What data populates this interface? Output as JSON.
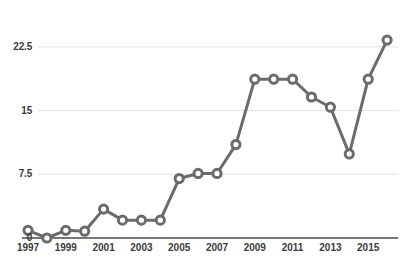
{
  "chart_data": {
    "type": "line",
    "title": "",
    "subtitle": "",
    "xlabel": "",
    "ylabel": "",
    "grid": true,
    "legend": null,
    "legend_position": "none",
    "line_color": "#6b6b6b",
    "marker_face_color": "#ffffff",
    "marker_edge_color": "#6b6b6b",
    "gridline_color": "#e2e2e2",
    "axis_color": "#4a4a4a",
    "ylim": [
      0,
      24.5
    ],
    "yticks": [
      0,
      7.5,
      15,
      22.5
    ],
    "ytick_labels": [
      "0",
      "7.5",
      "15",
      "22.5"
    ],
    "xlim": [
      1997,
      2016
    ],
    "xticks": [
      1997,
      1999,
      2001,
      2003,
      2005,
      2007,
      2009,
      2011,
      2013,
      2015
    ],
    "xtick_labels": [
      "1997",
      "1999",
      "2001",
      "2003",
      "2005",
      "2007",
      "2009",
      "2011",
      "2013",
      "2015"
    ],
    "x": [
      1997,
      1998,
      1999,
      2000,
      2001,
      2002,
      2003,
      2004,
      2005,
      2006,
      2007,
      2008,
      2009,
      2010,
      2011,
      2012,
      2013,
      2014,
      2015,
      2016
    ],
    "values": [
      0.9,
      0.0,
      0.9,
      0.8,
      3.4,
      2.1,
      2.1,
      2.1,
      7.0,
      7.6,
      7.6,
      11.0,
      18.7,
      18.7,
      18.7,
      16.6,
      15.4,
      9.9,
      18.7,
      23.3
    ],
    "series": [
      {
        "name": "",
        "values": [
          0.9,
          0.0,
          0.9,
          0.8,
          3.4,
          2.1,
          2.1,
          2.1,
          7.0,
          7.6,
          7.6,
          11.0,
          18.7,
          18.7,
          18.7,
          16.6,
          15.4,
          9.9,
          18.7,
          23.3
        ]
      }
    ]
  }
}
